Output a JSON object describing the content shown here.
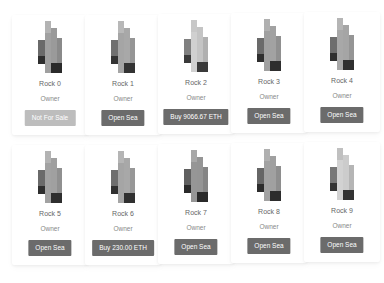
{
  "rocks": [
    {
      "name": "Rock 0",
      "owner": "Owner",
      "button": "Not For Sale",
      "disabled": true,
      "light": false
    },
    {
      "name": "Rock 1",
      "owner": "Owner",
      "button": "Open Sea",
      "disabled": false,
      "light": false
    },
    {
      "name": "Rock 2",
      "owner": "Owner",
      "button": "Buy 9066.67 ETH",
      "disabled": false,
      "light": true
    },
    {
      "name": "Rock 3",
      "owner": "Owner",
      "button": "Open Sea",
      "disabled": false,
      "light": false
    },
    {
      "name": "Rock 4",
      "owner": "Owner",
      "button": "Open Sea",
      "disabled": false,
      "light": false
    },
    {
      "name": "Rock 5",
      "owner": "Owner",
      "button": "Open Sea",
      "disabled": false,
      "light": false
    },
    {
      "name": "Rock 6",
      "owner": "Owner",
      "button": "Buy 230.00 ETH",
      "disabled": false,
      "light": false
    },
    {
      "name": "Rock 7",
      "owner": "Owner",
      "button": "Open Sea",
      "disabled": false,
      "light": false
    },
    {
      "name": "Rock 8",
      "owner": "Owner",
      "button": "Open Sea",
      "disabled": false,
      "light": false
    },
    {
      "name": "Rock 9",
      "owner": "Owner",
      "button": "Open Sea",
      "disabled": false,
      "light": true
    }
  ],
  "colors": {
    "button": "#6b6b6b",
    "button_disabled": "#bdbdbd"
  }
}
